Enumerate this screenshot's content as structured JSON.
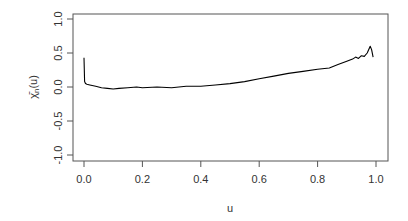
{
  "chart_data": {
    "type": "line",
    "title": "",
    "xlabel": "u",
    "ylabel": "χ̄n(u)",
    "xlim": [
      0,
      1
    ],
    "ylim": [
      -1,
      1
    ],
    "x_ticks": [
      "0.0",
      "0.2",
      "0.4",
      "0.6",
      "0.8",
      "1.0"
    ],
    "y_ticks": [
      "-1.0",
      "-0.5",
      "0.0",
      "0.5",
      "1.0"
    ],
    "grid": false,
    "legend": null,
    "series": [
      {
        "name": "chi_bar_n",
        "color": "#000000",
        "x": [
          0.0,
          0.002,
          0.005,
          0.01,
          0.02,
          0.04,
          0.06,
          0.08,
          0.1,
          0.12,
          0.15,
          0.18,
          0.2,
          0.25,
          0.3,
          0.35,
          0.4,
          0.45,
          0.5,
          0.55,
          0.6,
          0.65,
          0.7,
          0.75,
          0.8,
          0.84,
          0.87,
          0.9,
          0.92,
          0.93,
          0.94,
          0.95,
          0.96,
          0.97,
          0.98,
          0.985,
          0.99
        ],
        "y": [
          0.43,
          0.08,
          0.05,
          0.04,
          0.03,
          0.01,
          -0.01,
          -0.02,
          -0.03,
          -0.02,
          -0.01,
          0.0,
          -0.01,
          0.0,
          -0.01,
          0.01,
          0.01,
          0.03,
          0.05,
          0.08,
          0.12,
          0.16,
          0.2,
          0.23,
          0.26,
          0.28,
          0.33,
          0.38,
          0.41,
          0.44,
          0.42,
          0.46,
          0.45,
          0.5,
          0.6,
          0.55,
          0.44
        ]
      }
    ]
  },
  "axes": {
    "x_title": "u",
    "y_title_main": "χ̄",
    "y_title_sub": "n",
    "y_title_tail": "(u)"
  }
}
